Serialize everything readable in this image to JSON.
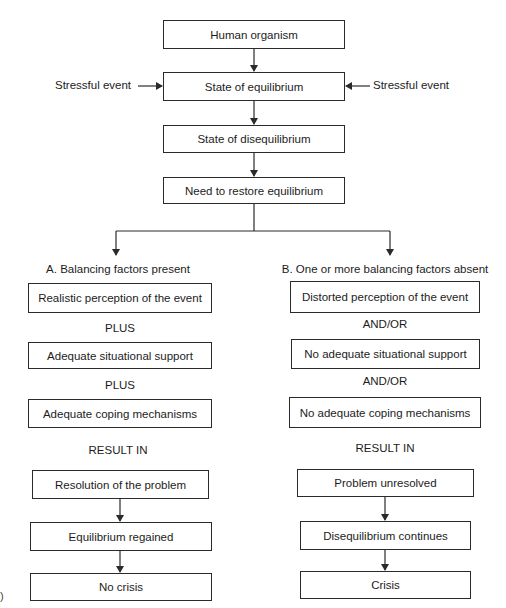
{
  "diagram": {
    "top_flow": {
      "human_organism": "Human organism",
      "state_of_equilibrium": "State of equilibrium",
      "state_of_disequilibrium": "State of disequilibrium",
      "need_to_restore": "Need to restore equilibrium",
      "stressful_event_left": "Stressful event",
      "stressful_event_right": "Stressful event"
    },
    "branch_a": {
      "title": "A. Balancing factors present",
      "factors": [
        "Realistic perception of the event",
        "Adequate situational support",
        "Adequate coping mechanisms"
      ],
      "connectors": [
        "PLUS",
        "PLUS"
      ],
      "result_label": "RESULT IN",
      "outcomes": [
        "Resolution of the problem",
        "Equilibrium regained",
        "No crisis"
      ]
    },
    "branch_b": {
      "title": "B. One or more balancing factors absent",
      "factors": [
        "Distorted perception of the event",
        "No adequate situational support",
        "No adequate coping mechanisms"
      ],
      "connectors": [
        "AND/OR",
        "AND/OR"
      ],
      "result_label": "RESULT IN",
      "outcomes": [
        "Problem unresolved",
        "Disequilibrium continues",
        "Crisis"
      ]
    },
    "edge_fragment": ")"
  },
  "colors": {
    "line": "#2a2a2a",
    "text": "#1c1c1c",
    "background": "#ffffff"
  }
}
